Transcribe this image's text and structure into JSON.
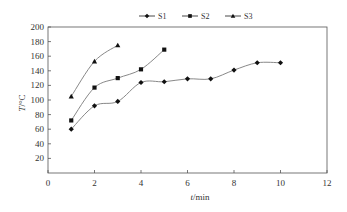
{
  "chart_data": {
    "type": "line",
    "title": "",
    "xlabel": "t/min",
    "ylabel": "T/°C",
    "xlim": [
      0,
      12
    ],
    "ylim": [
      0,
      200
    ],
    "xticks": [
      0,
      2,
      4,
      6,
      8,
      10,
      12
    ],
    "yticks": [
      20,
      40,
      60,
      80,
      100,
      120,
      140,
      160,
      180,
      200
    ],
    "grid": false,
    "legend_position": "top",
    "series": [
      {
        "name": "S1",
        "marker": "diamond",
        "x": [
          1,
          2,
          3,
          4,
          5,
          6,
          7,
          8,
          9,
          10
        ],
        "values": [
          60,
          92,
          98,
          124,
          125,
          129,
          129,
          141,
          151,
          151
        ]
      },
      {
        "name": "S2",
        "marker": "square",
        "x": [
          1,
          2,
          3,
          4,
          5
        ],
        "values": [
          72,
          117,
          130,
          142,
          169
        ]
      },
      {
        "name": "S3",
        "marker": "triangle",
        "x": [
          1,
          2,
          3
        ],
        "values": [
          105,
          153,
          175
        ]
      }
    ],
    "colors": {
      "line": "#7a7a7a",
      "marker": "#111111",
      "axis": "#555555"
    }
  },
  "axis": {
    "x_label_italic": "t",
    "x_label_unit": "/min",
    "y_label_italic": "T",
    "y_label_unit": "/°C"
  },
  "legend": [
    "S1",
    "S2",
    "S3"
  ]
}
